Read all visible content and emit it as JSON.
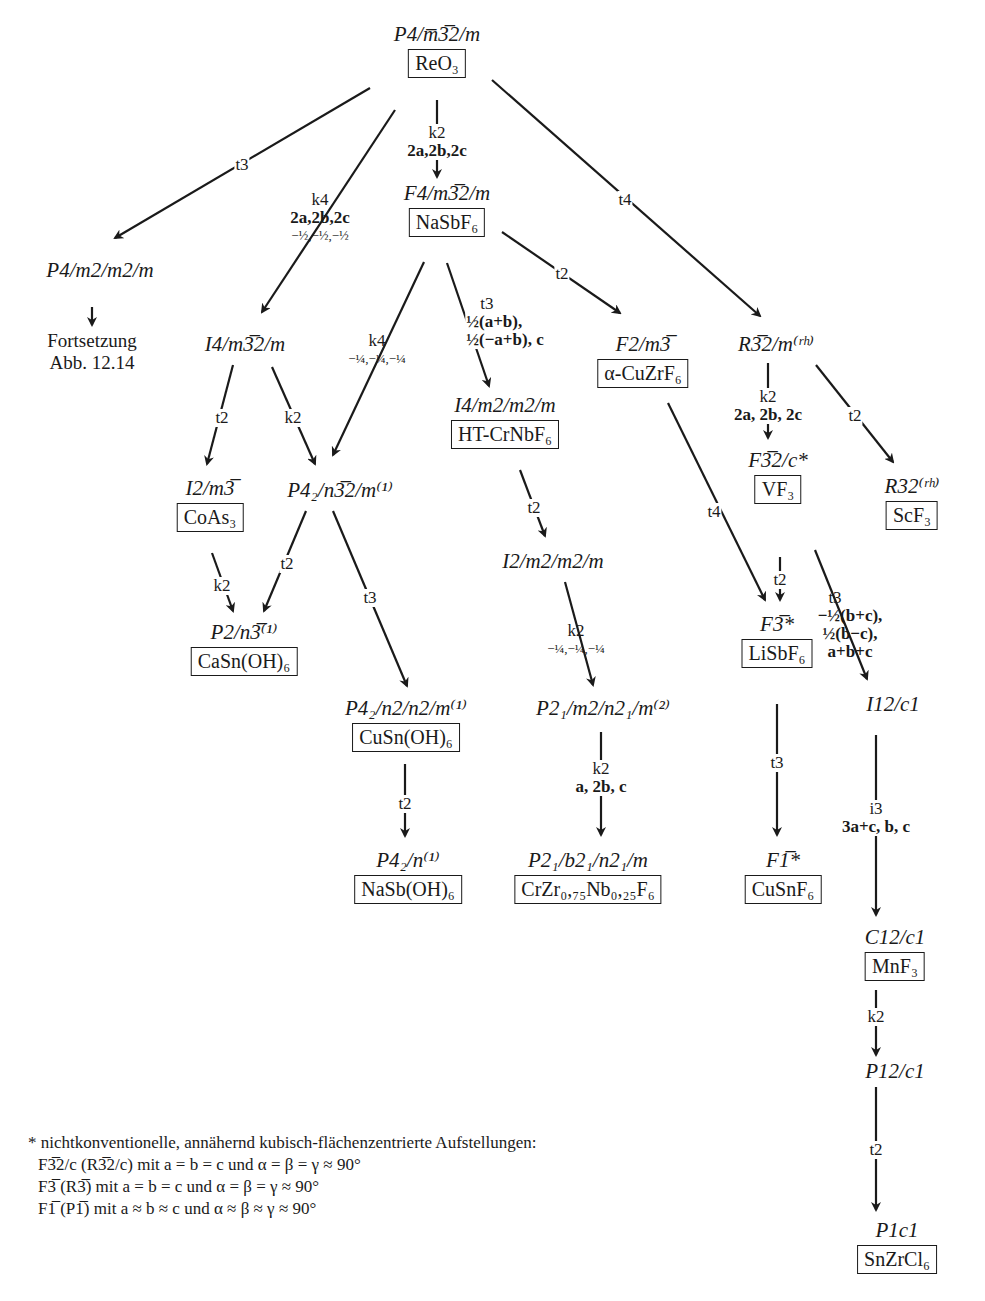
{
  "nodes": {
    "reo3": {
      "sg": "P4/m̅3̅2/m",
      "compound": "ReO₃"
    },
    "p4mmm": {
      "sg": "P4/m2/m2/m",
      "note1": "Fortsetzung",
      "note2": "Abb. 12.14"
    },
    "nasbf6": {
      "sg": "F4/m3̅2/m",
      "compound": "NaSbF₆"
    },
    "i4m32m": {
      "sg": "I4/m3̅2/m"
    },
    "f2m3": {
      "sg": "F2/m3̅",
      "compound": "α-CuZrF₆"
    },
    "r32m": {
      "sg": "R3̅2/m⁽ʳʰ⁾"
    },
    "i4mmm": {
      "sg": "I4/m2/m2/m",
      "compound": "HT-CrNbF₆"
    },
    "i2m3": {
      "sg": "I2/m3̅",
      "compound": "CoAs₃"
    },
    "p42n32m": {
      "sg": "P4₂/n3̅2/m⁽¹⁾"
    },
    "immm": {
      "sg": "I2/m2/m2/m"
    },
    "f32c": {
      "sg": "F3̅2/c*",
      "compound": "VF₃"
    },
    "r32": {
      "sg": "R32⁽ʳʰ⁾",
      "compound": "ScF₃"
    },
    "p2n3": {
      "sg": "P2/n3̅⁽¹⁾",
      "compound": "CaSn(OH)₆"
    },
    "f3": {
      "sg": "F3̅*",
      "compound": "LiSbF₆"
    },
    "p42nnm": {
      "sg": "P4₂/n2/n2/m⁽¹⁾",
      "compound": "CuSn(OH)₆"
    },
    "pmnm": {
      "sg": "P2₁/m2/n2₁/m⁽²⁾"
    },
    "i2c": {
      "sg": "I12/c1"
    },
    "p42n": {
      "sg": "P4₂/n⁽¹⁾",
      "compound": "NaSb(OH)₆"
    },
    "pbnm": {
      "sg": "P2₁/b2₁/n2₁/m",
      "compound": "CrZr₀,₇₅Nb₀,₂₅F₆"
    },
    "f1": {
      "sg": "F1̅*",
      "compound": "CuSnF₆"
    },
    "c2c": {
      "sg": "C12/c1",
      "compound": "MnF₃"
    },
    "p2c": {
      "sg": "P12/c1"
    },
    "pc": {
      "sg": "P1c1",
      "compound": "SnZrCl₆"
    }
  },
  "edges": {
    "reo3_p4mmm": {
      "index": "t3"
    },
    "reo3_i4m32m": {
      "index": "k4",
      "basis": "2a,2b,2c",
      "origin": "−½,−½,−½"
    },
    "reo3_nasbf6": {
      "index": "k2",
      "basis": "2a,2b,2c"
    },
    "reo3_r32m": {
      "index": "t4"
    },
    "nasbf6_p42n32m": {
      "index": "k4",
      "origin": "−¼,−¼,−¼"
    },
    "nasbf6_i4mmm": {
      "index": "t3",
      "basis1": "½(a+b),",
      "basis2": "½(−a+b), c"
    },
    "nasbf6_f2m3": {
      "index": "t2"
    },
    "i4m32m_i2m3": {
      "index": "t2"
    },
    "i4m32m_p42n32m": {
      "index": "k2"
    },
    "r32m_f32c": {
      "index": "k2",
      "basis": "2a, 2b, 2c"
    },
    "r32m_r32": {
      "index": "t2"
    },
    "i2m3_p2n3": {
      "index": "k2"
    },
    "p42n32m_p2n3": {
      "index": "t2"
    },
    "p42n32m_p42nnm": {
      "index": "t3"
    },
    "i4mmm_immm": {
      "index": "t2"
    },
    "immm_pmnm": {
      "index": "k2",
      "origin": "−¼,−¼,−¼"
    },
    "f2m3_f3": {
      "index": "t4"
    },
    "f32c_f3": {
      "index": "t2"
    },
    "f32c_i2c": {
      "index": "t3",
      "basis1": "−½(b+c),",
      "basis2": "½(b−c),",
      "basis3": "a+b+c"
    },
    "p42nnm_p42n": {
      "index": "t2"
    },
    "pmnm_pbnm": {
      "index": "k2",
      "basis": "a, 2b, c"
    },
    "f3_f1": {
      "index": "t3"
    },
    "i2c_c2c": {
      "index": "i3",
      "basis": "3a+c, b, c"
    },
    "c2c_p2c": {
      "index": "k2"
    },
    "p2c_pc": {
      "index": "t2"
    }
  },
  "footnote": {
    "title": "* nichtkonventionelle, annähernd kubisch-flächenzentrierte Aufstellungen:",
    "line1": "F3̅2/c (R3̅2/c) mit a = b = c und α = β = γ ≈ 90°",
    "line2": "F3̅ (R3̅) mit a = b = c und α = β = γ ≈ 90°",
    "line3": "F1̅ (P1̅) mit a ≈ b ≈ c und α ≈ β ≈ γ ≈ 90°"
  }
}
